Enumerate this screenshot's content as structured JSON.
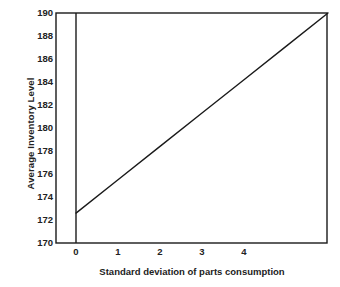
{
  "chart_data": {
    "type": "line",
    "title": "",
    "subtitle": "",
    "xlabel": "Standard deviation of parts consumption",
    "ylabel": "Average Inventory Level",
    "xlim": [
      -0.5,
      6.0
    ],
    "ylim": [
      170,
      190
    ],
    "xticks": [
      0,
      1,
      2,
      3,
      4
    ],
    "xtick_labels": [
      "0",
      "1",
      "2",
      "3",
      "4"
    ],
    "yticks": [
      170,
      172,
      174,
      176,
      178,
      180,
      182,
      184,
      186,
      188,
      190
    ],
    "ytick_labels": [
      "170",
      "172",
      "174",
      "176",
      "178",
      "180",
      "182",
      "184",
      "186",
      "188",
      "190"
    ],
    "grid": false,
    "legend": null,
    "legend_position": "none",
    "series": [
      {
        "name": "Average inventory level",
        "style": "solid",
        "color": "#1a1a1a",
        "x": [
          0,
          1,
          2,
          3,
          4,
          5,
          6
        ],
        "y": [
          172.6,
          175.5,
          178.4,
          181.3,
          184.2,
          187.1,
          190.0
        ]
      }
    ],
    "annotations": []
  },
  "axes": {
    "y_axis_line_at_x": 0,
    "frame": "box"
  },
  "figure": {
    "background": "#ffffff",
    "line_color": "#1a1a1a",
    "axis_color": "#1a1a1a",
    "text_color": "#222222"
  }
}
